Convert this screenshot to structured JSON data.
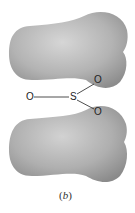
{
  "diagram": {
    "caption": "(b)",
    "caption_letter": "b",
    "atoms": {
      "center": "S",
      "left": "O",
      "upper_right": "O",
      "lower_right": "O"
    },
    "colors": {
      "lobe_light": "#cfcfcf",
      "lobe_mid": "#a9a9a9",
      "lobe_dark": "#8a8a8a",
      "bond": "#222222",
      "background": "#ffffff"
    },
    "lobes": [
      {
        "name": "upper-lobe"
      },
      {
        "name": "lower-lobe"
      }
    ]
  }
}
